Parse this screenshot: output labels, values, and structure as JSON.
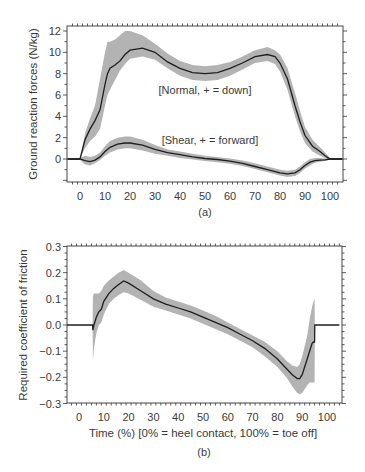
{
  "chart_data": [
    {
      "type": "line",
      "panel": "(a)",
      "title": "",
      "xlabel": "",
      "ylabel": "Ground reaction forces (N/kg)",
      "xlim": [
        -5,
        105
      ],
      "ylim": [
        -2.2,
        12.8
      ],
      "xticks": [
        0,
        10,
        20,
        30,
        40,
        50,
        60,
        70,
        80,
        90,
        100
      ],
      "yticks": [
        0,
        2,
        4,
        6,
        8,
        10,
        12
      ],
      "grid": false,
      "annotations": [
        "[Normal, + = down]",
        "[Shear, + = forward]"
      ],
      "series": [
        {
          "name": "Normal, + = down",
          "x": [
            -5,
            0,
            2,
            4,
            6,
            8,
            10,
            11,
            12,
            14,
            16,
            18,
            20,
            25,
            30,
            35,
            40,
            45,
            50,
            55,
            60,
            65,
            70,
            75,
            78,
            80,
            83,
            86,
            88,
            90,
            93,
            96,
            98,
            100,
            105
          ],
          "mean": [
            0,
            0,
            1.8,
            2.8,
            3.6,
            4.6,
            7.0,
            8.0,
            8.5,
            8.8,
            9.2,
            9.8,
            10.2,
            10.4,
            10.0,
            9.1,
            8.5,
            8.1,
            8.0,
            8.1,
            8.5,
            9.0,
            9.6,
            9.8,
            9.6,
            9.0,
            7.5,
            5.0,
            3.5,
            2.2,
            1.2,
            0.7,
            0.3,
            0,
            0
          ],
          "upper": [
            0,
            0,
            2.4,
            3.8,
            5.0,
            7.5,
            10.0,
            11.0,
            11.0,
            11.2,
            11.6,
            12.0,
            12.0,
            11.6,
            10.8,
            9.9,
            9.2,
            8.8,
            8.7,
            8.8,
            9.1,
            9.6,
            10.2,
            10.5,
            10.2,
            9.8,
            8.5,
            6.2,
            4.5,
            3.0,
            1.8,
            1.1,
            0.6,
            0.1,
            0
          ],
          "lower": [
            0,
            0,
            1.0,
            1.7,
            2.1,
            2.8,
            5.0,
            6.0,
            6.5,
            7.4,
            8.3,
            8.9,
            9.4,
            9.6,
            9.3,
            8.5,
            7.8,
            7.4,
            7.3,
            7.4,
            7.8,
            8.4,
            9.0,
            9.2,
            8.9,
            8.2,
            6.5,
            4.0,
            2.6,
            1.5,
            0.7,
            0.3,
            0.1,
            -0.1,
            0
          ]
        },
        {
          "name": "Shear, + = forward",
          "x": [
            -5,
            0,
            2,
            4,
            6,
            8,
            10,
            12,
            15,
            18,
            20,
            25,
            30,
            35,
            40,
            45,
            50,
            55,
            60,
            65,
            70,
            75,
            80,
            83,
            86,
            88,
            90,
            92,
            94,
            96,
            98,
            100,
            105
          ],
          "mean": [
            0,
            0,
            -0.15,
            -0.25,
            -0.1,
            0.2,
            0.7,
            1.1,
            1.4,
            1.5,
            1.5,
            1.3,
            0.9,
            0.6,
            0.4,
            0.2,
            0.05,
            -0.05,
            -0.2,
            -0.4,
            -0.7,
            -1.0,
            -1.3,
            -1.4,
            -1.3,
            -1.0,
            -0.6,
            -0.3,
            -0.15,
            -0.1,
            -0.08,
            0,
            0
          ],
          "upper": [
            0,
            0.1,
            0.3,
            0.2,
            0.3,
            0.6,
            1.2,
            1.7,
            2.0,
            2.1,
            2.1,
            1.8,
            1.3,
            0.9,
            0.7,
            0.5,
            0.3,
            0.2,
            0.05,
            -0.15,
            -0.4,
            -0.7,
            -1.0,
            -1.1,
            -1.0,
            -0.7,
            -0.3,
            0,
            0.1,
            0.1,
            0.05,
            0.05,
            0
          ],
          "lower": [
            0,
            -0.1,
            -0.5,
            -0.6,
            -0.4,
            -0.1,
            0.3,
            0.6,
            0.9,
            1.0,
            1.0,
            0.8,
            0.5,
            0.3,
            0.1,
            -0.05,
            -0.2,
            -0.3,
            -0.45,
            -0.65,
            -0.95,
            -1.25,
            -1.55,
            -1.7,
            -1.6,
            -1.3,
            -0.9,
            -0.6,
            -0.35,
            -0.25,
            -0.2,
            -0.05,
            0
          ]
        }
      ]
    },
    {
      "type": "line",
      "panel": "(b)",
      "title": "",
      "xlabel": "Time (%) [0% = heel contact, 100% = toe off]",
      "ylabel": "Required coefficient of friction",
      "xlim": [
        -5,
        105
      ],
      "ylim": [
        -0.3,
        0.3
      ],
      "xticks": [
        0,
        10,
        20,
        30,
        40,
        50,
        60,
        70,
        80,
        90,
        100
      ],
      "yticks": [
        -0.3,
        -0.2,
        -0.1,
        0.0,
        0.1,
        0.2,
        0.3
      ],
      "ytick_labels": [
        "−0.3",
        "−0.2",
        "−0.1",
        "0.0",
        "0.1",
        "0.2",
        "0.3"
      ],
      "grid": false,
      "series": [
        {
          "name": "Required coefficient of friction",
          "x": [
            -5,
            5.5,
            5.6,
            6,
            7,
            8,
            9,
            10,
            12,
            14,
            16,
            18,
            20,
            25,
            30,
            35,
            40,
            45,
            50,
            55,
            60,
            65,
            70,
            75,
            80,
            84,
            86,
            88,
            89,
            90,
            92,
            93,
            94,
            94.5,
            95,
            95.1,
            105
          ],
          "mean": [
            0,
            0,
            -0.02,
            0.0,
            0.03,
            0.05,
            0.06,
            0.09,
            0.12,
            0.14,
            0.155,
            0.168,
            0.16,
            0.13,
            0.1,
            0.08,
            0.065,
            0.05,
            0.03,
            0.01,
            -0.01,
            -0.035,
            -0.06,
            -0.09,
            -0.13,
            -0.17,
            -0.19,
            -0.205,
            -0.205,
            -0.19,
            -0.13,
            -0.1,
            -0.07,
            -0.065,
            -0.065,
            0,
            0
          ],
          "upper": [
            0,
            0,
            0.11,
            0.12,
            0.12,
            0.12,
            0.13,
            0.15,
            0.17,
            0.185,
            0.2,
            0.21,
            0.2,
            0.17,
            0.13,
            0.105,
            0.09,
            0.075,
            0.055,
            0.035,
            0.01,
            -0.015,
            -0.04,
            -0.065,
            -0.1,
            -0.14,
            -0.155,
            -0.16,
            -0.15,
            -0.12,
            -0.04,
            0.02,
            0.07,
            0.09,
            0.1,
            0,
            0
          ],
          "lower": [
            0,
            0,
            -0.14,
            -0.09,
            -0.03,
            0.0,
            0.01,
            0.04,
            0.08,
            0.1,
            0.115,
            0.125,
            0.12,
            0.095,
            0.07,
            0.055,
            0.04,
            0.025,
            0.005,
            -0.015,
            -0.035,
            -0.06,
            -0.085,
            -0.12,
            -0.16,
            -0.205,
            -0.235,
            -0.26,
            -0.265,
            -0.26,
            -0.23,
            -0.22,
            -0.22,
            -0.22,
            -0.22,
            0,
            0
          ]
        }
      ]
    }
  ],
  "panel_a": {
    "ylabel": "Ground reaction forces (N/kg)",
    "label": "(a)",
    "annot_normal": "[Normal, + = down]",
    "annot_shear": "[Shear, + = forward]",
    "yticklabels": [
      "0",
      "2",
      "4",
      "6",
      "8",
      "10",
      "12"
    ],
    "xticklabels": [
      "0",
      "10",
      "20",
      "30",
      "40",
      "50",
      "60",
      "70",
      "80",
      "90",
      "100"
    ]
  },
  "panel_b": {
    "ylabel": "Required coefficient of friction",
    "xlabel": "Time (%) [0% = heel contact, 100% = toe off]",
    "label": "(b)",
    "yticklabels": [
      "−0.3",
      "−0.2",
      "−0.1",
      "0.0",
      "0.1",
      "0.2",
      "0.3"
    ],
    "xticklabels": [
      "0",
      "10",
      "20",
      "30",
      "40",
      "50",
      "60",
      "70",
      "80",
      "90",
      "100"
    ]
  },
  "colors": {
    "band": "#b3b3b3",
    "mean_line": "#1e1e1e",
    "axis": "#333333",
    "text": "#3a3a3a"
  }
}
